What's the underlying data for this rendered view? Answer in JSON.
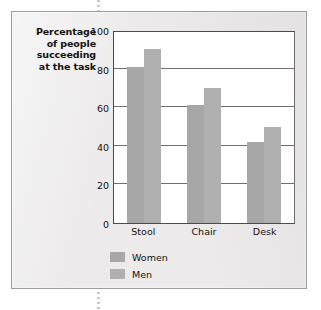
{
  "chart_data": {
    "type": "bar",
    "title": "",
    "xlabel": "",
    "ylabel": "Percentage of people succeeding at the task",
    "ylabel_lines": [
      "Percentage",
      "of people",
      "succeeding",
      "at the task"
    ],
    "categories": [
      "Stool",
      "Chair",
      "Desk"
    ],
    "series": [
      {
        "name": "Women",
        "color": "#a7a7a7",
        "values": [
          81,
          61,
          42
        ]
      },
      {
        "name": "Men",
        "color": "#b0b0b0",
        "values": [
          90,
          70,
          50
        ]
      }
    ],
    "ylim": [
      0,
      100
    ],
    "yticks": [
      0,
      20,
      40,
      60,
      80,
      100
    ],
    "ytick_labels": [
      "0",
      "20",
      "40",
      "60",
      "80",
      "100"
    ],
    "gridlines": [
      20,
      40,
      60,
      80
    ],
    "grid": true,
    "legend_position": "bottom-left",
    "legend_entries": [
      "Women",
      "Men"
    ]
  },
  "figure": {
    "background_color": "#eceaea",
    "plot_background_color": "#ffffff",
    "border_color": "#9e9e9e",
    "axis_color": "#4a4a4a",
    "grid_color": "#6f6f6f",
    "text_color": "#14120f"
  }
}
